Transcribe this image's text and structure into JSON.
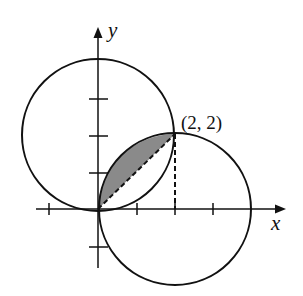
{
  "diagram": {
    "axis_labels": {
      "x": "x",
      "y": "y"
    },
    "point_label": "(2, 2)",
    "x_ticks": [
      -1,
      1,
      2,
      3
    ],
    "y_ticks": [
      -1,
      1,
      2,
      3
    ],
    "circles": [
      {
        "name": "upper-left-circle",
        "center": [
          0,
          2
        ],
        "radius": 2
      },
      {
        "name": "lower-right-circle",
        "center": [
          2,
          0
        ],
        "radius": 2
      }
    ],
    "shaded_region": "segment of lower-right circle between chord y=x from (0,0) to (2,2)",
    "dashed_lines": [
      "chord from (0,0) to (2,2)",
      "vertical from (2,2) to (2,0)"
    ],
    "colors": {
      "stroke": "#111111",
      "shade": "#8a8a8a",
      "background": "#ffffff"
    }
  }
}
